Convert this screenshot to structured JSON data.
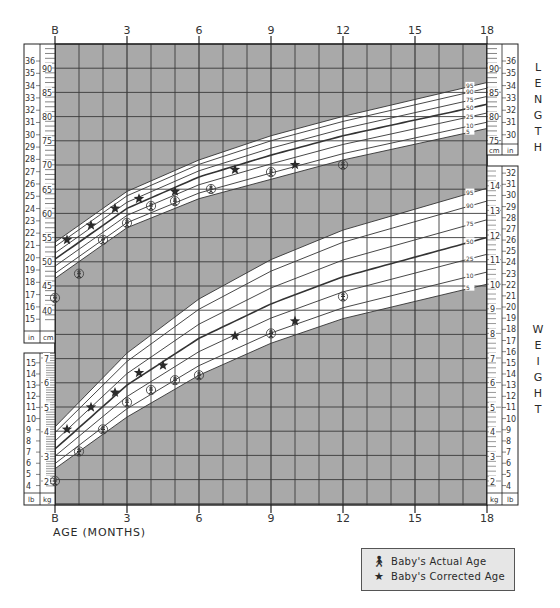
{
  "chart_data": {
    "type": "scatter",
    "xlabel": "AGE (MONTHS)",
    "x_ticks": [
      "B",
      "3",
      "6",
      "9",
      "12",
      "15",
      "18"
    ],
    "x_tick_values": [
      0,
      3,
      6,
      9,
      12,
      15,
      18
    ],
    "xlim": [
      0,
      18
    ],
    "grid": true,
    "panels": [
      {
        "name": "LENGTH",
        "units_left": [
          "in",
          "cm"
        ],
        "units_right": [
          "cm",
          "in"
        ],
        "cm_ticks_left": [
          40,
          45,
          50,
          55,
          60,
          65,
          70,
          75,
          80,
          85,
          90
        ],
        "in_ticks_left": [
          15,
          16,
          17,
          18,
          19,
          20,
          21,
          22,
          23,
          24,
          25,
          26,
          27,
          28,
          29,
          30,
          31,
          32,
          33,
          34,
          35,
          36
        ],
        "cm_ticks_right": [
          75,
          80,
          85,
          90
        ],
        "in_ticks_right": [
          30,
          31,
          32,
          33,
          34,
          35,
          36
        ],
        "ylim_cm": [
          38,
          95
        ],
        "percentiles": [
          "95",
          "90",
          "75",
          "50",
          "25",
          "10",
          "5"
        ],
        "percentile_curves_cm": {
          "5": [
            [
              0,
              46.5
            ],
            [
              3,
              57
            ],
            [
              6,
              63
            ],
            [
              9,
              67
            ],
            [
              12,
              71
            ],
            [
              18,
              77.5
            ]
          ],
          "50": [
            [
              0,
              50.5
            ],
            [
              3,
              61
            ],
            [
              6,
              67.5
            ],
            [
              9,
              72
            ],
            [
              12,
              76
            ],
            [
              18,
              82.5
            ]
          ],
          "95": [
            [
              0,
              54
            ],
            [
              3,
              64.5
            ],
            [
              6,
              71
            ],
            [
              9,
              76
            ],
            [
              12,
              80
            ],
            [
              18,
              87
            ]
          ]
        },
        "series": [
          {
            "name": "Baby's Actual Age",
            "points": [
              [
                0,
                42.5
              ],
              [
                1,
                47.5
              ],
              [
                2,
                54.5
              ],
              [
                3,
                58
              ],
              [
                4,
                61.5
              ],
              [
                5,
                62.5
              ],
              [
                6.5,
                65
              ],
              [
                9,
                68.5
              ],
              [
                12,
                70
              ]
            ]
          },
          {
            "name": "Baby's Corrected Age",
            "points": [
              [
                0.5,
                54.5
              ],
              [
                1.5,
                57.5
              ],
              [
                2.5,
                61
              ],
              [
                3.5,
                63
              ],
              [
                5,
                64.5
              ],
              [
                7.5,
                69
              ],
              [
                10,
                70
              ]
            ]
          }
        ]
      },
      {
        "name": "WEIGHT",
        "units_left": [
          "lb",
          "kg"
        ],
        "units_right": [
          "kg",
          "lb"
        ],
        "kg_ticks_left": [
          2,
          3,
          4,
          5,
          6,
          7
        ],
        "lb_ticks_left": [
          4,
          5,
          6,
          7,
          8,
          9,
          10,
          11,
          12,
          13,
          14,
          15
        ],
        "kg_ticks_right": [
          2,
          3,
          4,
          5,
          6,
          7,
          8,
          9,
          10,
          11,
          12,
          13,
          14
        ],
        "lb_ticks_right": [
          4,
          5,
          6,
          7,
          8,
          9,
          10,
          11,
          12,
          13,
          14,
          15,
          16,
          17,
          18,
          19,
          20,
          21,
          22,
          23,
          24,
          25,
          26,
          27,
          28,
          29,
          30,
          31,
          32
        ],
        "ylim_kg": [
          1.5,
          15
        ],
        "percentiles": [
          "95",
          "90",
          "75",
          "50",
          "25",
          "10",
          "5"
        ],
        "percentile_curves_kg": {
          "5": [
            [
              0,
              2.5
            ],
            [
              3,
              4.6
            ],
            [
              6,
              6.3
            ],
            [
              9,
              7.6
            ],
            [
              12,
              8.6
            ],
            [
              18,
              10
            ]
          ],
          "50": [
            [
              0,
              3.3
            ],
            [
              3,
              5.9
            ],
            [
              6,
              7.8
            ],
            [
              9,
              9.2
            ],
            [
              12,
              10.3
            ],
            [
              18,
              11.9
            ]
          ],
          "95": [
            [
              0,
              4.2
            ],
            [
              3,
              7.2
            ],
            [
              6,
              9.4
            ],
            [
              9,
              11
            ],
            [
              12,
              12.2
            ],
            [
              18,
              13.9
            ]
          ]
        },
        "series": [
          {
            "name": "Baby's Actual Age",
            "points": [
              [
                0,
                2.0
              ],
              [
                1,
                3.2
              ],
              [
                2,
                4.1
              ],
              [
                3,
                5.2
              ],
              [
                4,
                5.7
              ],
              [
                5,
                6.1
              ],
              [
                6,
                6.3
              ],
              [
                9,
                8.0
              ],
              [
                12,
                9.5
              ]
            ]
          },
          {
            "name": "Baby's Corrected Age",
            "points": [
              [
                0.5,
                4.1
              ],
              [
                1.5,
                5.0
              ],
              [
                2.5,
                5.6
              ],
              [
                3.5,
                6.4
              ],
              [
                4.5,
                6.7
              ],
              [
                7.5,
                7.9
              ],
              [
                10,
                8.5
              ]
            ]
          }
        ]
      }
    ],
    "legend": [
      "Baby's Actual Age",
      "Baby's Corrected Age"
    ],
    "legend_position": "bottom-right"
  },
  "side_labels": {
    "length": "LENGTH",
    "weight": "WEIGHT"
  },
  "legend": {
    "actual": "Baby's Actual Age",
    "corrected": "Baby's Corrected Age"
  },
  "axis": {
    "xlabel": "AGE (MONTHS)"
  },
  "colors": {
    "grid_bg": "#a9a9a9",
    "band": "#ffffff",
    "line": "#333333",
    "legend_bg": "#e6e6e6"
  }
}
